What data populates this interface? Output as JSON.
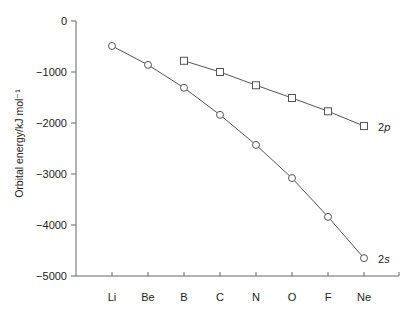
{
  "chart_data": {
    "type": "line",
    "title": "",
    "xlabel": "",
    "ylabel": "Orbital energy/kJ mol⁻¹",
    "categories": [
      "Li",
      "Be",
      "B",
      "C",
      "N",
      "O",
      "F",
      "Ne"
    ],
    "ylim": [
      -5000,
      0
    ],
    "yticks": [
      0,
      -1000,
      -2000,
      -3000,
      -4000,
      -5000
    ],
    "ytick_labels": [
      "0",
      "−1000",
      "−2000",
      "−3000",
      "−4000",
      "−5000"
    ],
    "grid": false,
    "legend": "inline labels at line ends",
    "series": [
      {
        "name": "2s",
        "label_main": "2",
        "label_sub": "s",
        "marker": "circle",
        "values": [
          -490,
          -860,
          -1310,
          -1840,
          -2430,
          -3080,
          -3840,
          -4650
        ]
      },
      {
        "name": "2p",
        "label_main": "2",
        "label_sub": "p",
        "marker": "square",
        "values": [
          null,
          null,
          -780,
          -1000,
          -1260,
          -1510,
          -1770,
          -2060
        ]
      }
    ]
  },
  "colors": {
    "line": "#555555",
    "axis": "#666666",
    "text": "#222222"
  }
}
